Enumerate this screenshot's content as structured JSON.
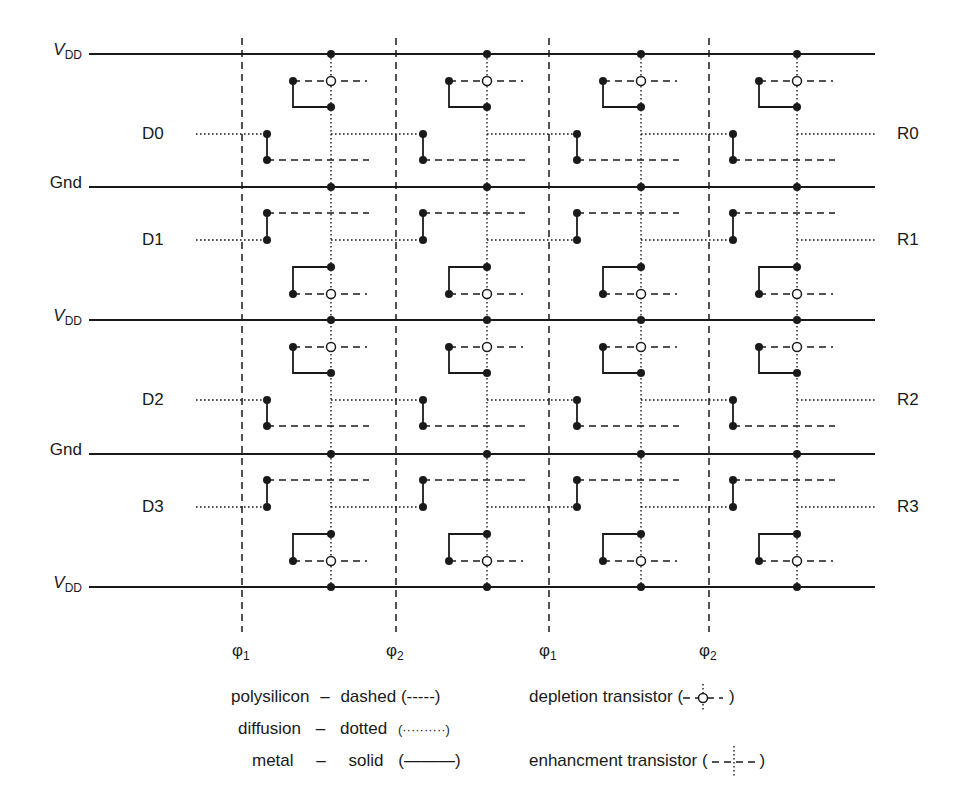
{
  "diagram": {
    "rails": [
      {
        "label_main": "V",
        "label_sub": "DD",
        "italic": true,
        "y": 54,
        "type": "vdd"
      },
      {
        "label_main": "Gnd",
        "label_sub": "",
        "italic": false,
        "y": 187,
        "type": "gnd"
      },
      {
        "label_main": "V",
        "label_sub": "DD",
        "italic": true,
        "y": 320,
        "type": "vdd"
      },
      {
        "label_main": "Gnd",
        "label_sub": "",
        "italic": false,
        "y": 454,
        "type": "gnd"
      },
      {
        "label_main": "V",
        "label_sub": "DD",
        "italic": true,
        "y": 587,
        "type": "vdd"
      }
    ],
    "inputs": [
      {
        "label": "D0",
        "y": 134
      },
      {
        "label": "D1",
        "y": 240
      },
      {
        "label": "D2",
        "y": 400
      },
      {
        "label": "D3",
        "y": 507
      }
    ],
    "outputs": [
      {
        "label": "R0",
        "y": 134
      },
      {
        "label": "R1",
        "y": 240
      },
      {
        "label": "R2",
        "y": 400
      },
      {
        "label": "R3",
        "y": 507
      }
    ],
    "clocks": [
      {
        "symbol": "φ",
        "sub": "1",
        "x": 242
      },
      {
        "symbol": "φ",
        "sub": "2",
        "x": 396
      },
      {
        "symbol": "φ",
        "sub": "1",
        "x": 549
      },
      {
        "symbol": "φ",
        "sub": "2",
        "x": 709
      }
    ],
    "columns": [
      331,
      487,
      641,
      797
    ],
    "colors": {
      "ink": "#1a1a1a",
      "background": "#ffffff"
    }
  },
  "legend": {
    "left": [
      {
        "material": "polysilicon",
        "dash": "–",
        "style": "dashed",
        "sample": "(-----)"
      },
      {
        "material": "diffusion",
        "dash": "–",
        "style": "dotted",
        "sample": "(··········)"
      },
      {
        "material": "metal",
        "dash": "–",
        "style": "solid",
        "sample": "(———)"
      }
    ],
    "right": [
      {
        "label": "depletion transistor",
        "symbol": "depletion"
      },
      {
        "label": "enhancment transistor",
        "symbol": "enhancement"
      }
    ]
  }
}
